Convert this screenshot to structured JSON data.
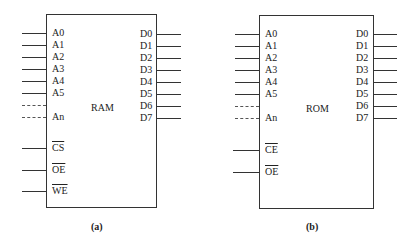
{
  "diagrams": [
    {
      "id": "a",
      "chip_label": "RAM",
      "caption": "(a)",
      "address_pins": [
        "A0",
        "A1",
        "A2",
        "A3",
        "A4",
        "A5"
      ],
      "address_last_pin": "An",
      "data_pins": [
        "D0",
        "D1",
        "D2",
        "D3",
        "D4",
        "D5",
        "D6",
        "D7"
      ],
      "control_pins": [
        "CS",
        "OE",
        "WE"
      ],
      "control_pins_active_low": true
    },
    {
      "id": "b",
      "chip_label": "ROM",
      "caption": "(b)",
      "address_pins": [
        "A0",
        "A1",
        "A2",
        "A3",
        "A4",
        "A5"
      ],
      "address_last_pin": "An",
      "data_pins": [
        "D0",
        "D1",
        "D2",
        "D3",
        "D4",
        "D5",
        "D6",
        "D7"
      ],
      "control_pins": [
        "CE",
        "OE"
      ],
      "control_pins_active_low": true
    }
  ]
}
